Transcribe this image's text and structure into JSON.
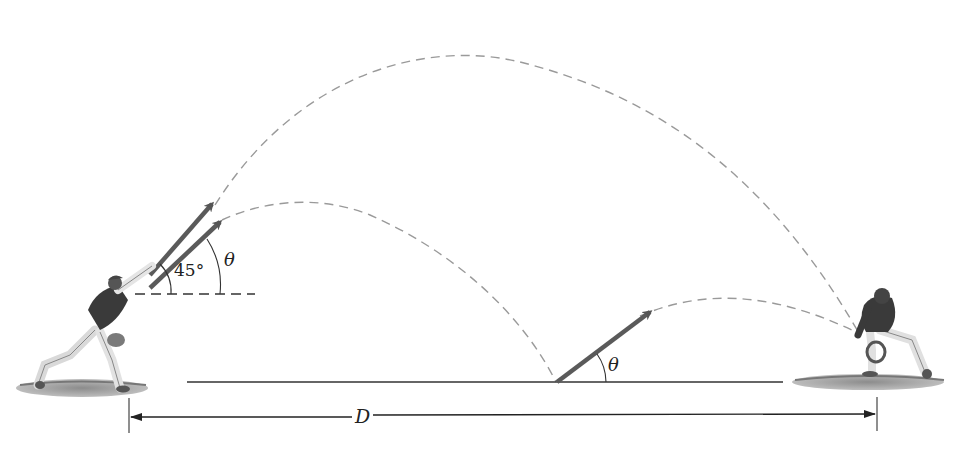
{
  "diagram": {
    "type": "projectile-motion-figure",
    "labels": {
      "angle_45": "45°",
      "theta_upper": "θ",
      "theta_lower": "θ",
      "distance": "D"
    },
    "elements": {
      "thrower": "outfielder throwing player",
      "catcher": "fielder catching player",
      "trajectory_direct": "dashed parabola launched at 45°",
      "trajectory_bounce_first": "dashed parabola launched at θ, lands on ground",
      "trajectory_bounce_second": "dashed parabola after bounce at θ",
      "ground_line": "solid horizontal ground line",
      "dimension": "double-headed arrow spanning thrower to catcher labeled D"
    },
    "colors": {
      "dashed_path": "#9a9a9a",
      "arrow": "#5a5a5a",
      "line": "#333333",
      "grass": "#8a8a8a",
      "jersey": "#3a3a3a"
    }
  }
}
